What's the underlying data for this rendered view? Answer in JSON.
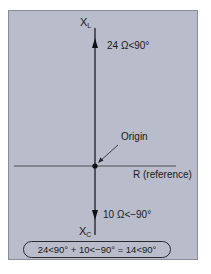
{
  "diagram": {
    "type": "phasor-diagram",
    "background_color": "#b9bccb",
    "axes": {
      "vertical_top_label": "X",
      "vertical_top_subscript": "L",
      "vertical_bottom_label": "X",
      "vertical_bottom_subscript": "C",
      "horizontal_label": "R (reference)"
    },
    "vectors": [
      {
        "name": "inductive-reactance",
        "label": "24 Ω<90°",
        "magnitude": 24,
        "angle_deg": 90,
        "direction": "up"
      },
      {
        "name": "capacitive-reactance",
        "label": "10 Ω<−90°",
        "magnitude": 10,
        "angle_deg": -90,
        "direction": "down"
      }
    ],
    "origin_label": "Origin",
    "equation": "24<90° + 10<−90° = 14<90°"
  }
}
